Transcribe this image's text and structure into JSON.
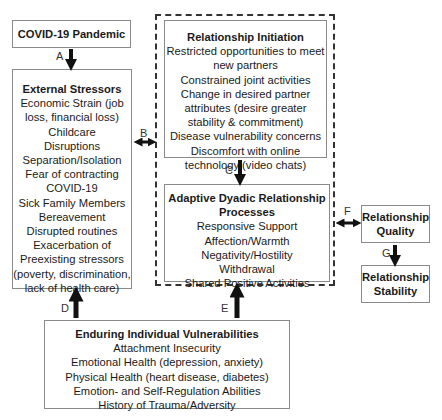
{
  "covid": {
    "title": "COVID-19 Pandemic"
  },
  "external": {
    "title": "External Stressors",
    "items": [
      "Economic Strain (job",
      "loss, financial loss)",
      "Childcare",
      "Disruptions",
      "Separation/Isolation",
      "Fear of contracting",
      "COVID-19",
      "Sick Family Members",
      "Bereavement",
      "Disrupted routines",
      "Exacerbation of",
      "Preexisting stressors",
      "(poverty, discrimination,",
      "lack of health care)"
    ]
  },
  "initiation": {
    "title": "Relationship Initiation",
    "items": [
      "Restricted opportunities to meet",
      "new partners",
      "Constrained joint activities",
      "Change in desired partner",
      "attributes (desire greater",
      "stability & commitment)",
      "Disease vulnerability concerns",
      "Discomfort with online",
      "technology (video chats)"
    ]
  },
  "adaptive": {
    "title": [
      "Adaptive Dyadic Relationship",
      "Processes"
    ],
    "items": [
      "Responsive Support",
      "Affection/Warmth",
      "Negativity/Hostility",
      "Withdrawal",
      "Shared Positive Activities"
    ]
  },
  "quality": {
    "title": [
      "Relationship",
      "Quality"
    ]
  },
  "stability": {
    "title": [
      "Relationship",
      "Stability"
    ]
  },
  "vulnerabilities": {
    "title": "Enduring Individual Vulnerabilities",
    "items": [
      "Attachment Insecurity",
      "Emotional Health (depression, anxiety)",
      "Physical Health (heart disease, diabetes)",
      "Emotion- and Self-Regulation Abilities",
      "History of Trauma/Adversity"
    ]
  },
  "paths": {
    "a": "A",
    "b": "B",
    "c": "C",
    "d": "D",
    "e": "E",
    "f": "F",
    "g": "G"
  }
}
